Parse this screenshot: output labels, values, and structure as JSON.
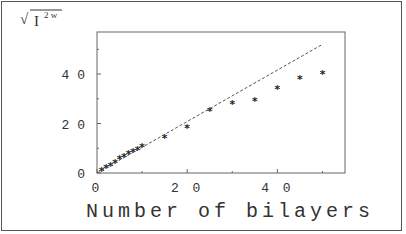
{
  "chart_data": {
    "type": "scatter",
    "title": "",
    "xlabel": "Number of bilayers",
    "ylabel": "sqrt(I^2w)",
    "ylabel_display": {
      "base": "I",
      "superscript": "2 w"
    },
    "xlim": [
      0,
      55
    ],
    "ylim": [
      0,
      57
    ],
    "xticks": [
      "0",
      "20",
      "40"
    ],
    "yticks": [
      "0",
      "20",
      "40"
    ],
    "grid": false,
    "legend": null,
    "series": [
      {
        "name": "measured",
        "marker": "asterisk",
        "x": [
          1,
          2,
          3,
          4,
          5,
          6,
          7,
          8,
          9,
          10,
          15,
          20,
          25,
          30,
          35,
          40,
          45,
          50
        ],
        "y": [
          1,
          2,
          3,
          4,
          5.5,
          6.5,
          7.5,
          8.5,
          9.5,
          10.5,
          14,
          18,
          25,
          28,
          29,
          34,
          38,
          40
        ]
      },
      {
        "name": "linear fit",
        "style": "dashed",
        "x": [
          0,
          50
        ],
        "y": [
          0,
          52
        ]
      }
    ]
  }
}
